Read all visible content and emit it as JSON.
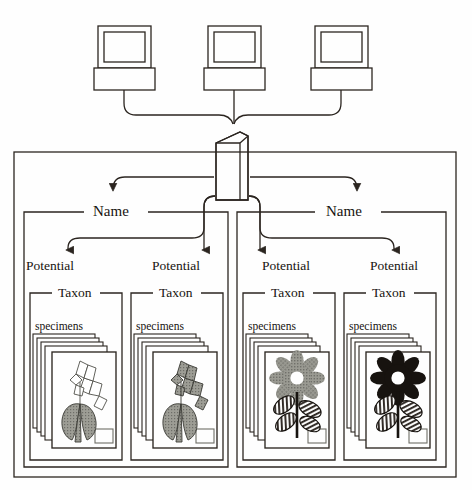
{
  "diagram": {
    "colors": {
      "line": "#2b2520",
      "background": "#fefefe",
      "leaf_gray": "#8d8d85",
      "flower_gray": "#8a8a83",
      "flower_black": "#17130f"
    },
    "clients": [
      {
        "name": "client-workstation-1"
      },
      {
        "name": "client-workstation-2"
      },
      {
        "name": "client-workstation-3"
      }
    ],
    "server": {
      "name": "database-server"
    },
    "name_groups": [
      {
        "label": "Name",
        "potentials": [
          {
            "label": "Potential",
            "taxon": {
              "label": "Taxon",
              "specimens_label": "specimens",
              "card_count": 5,
              "illustration": "grass-outline-head"
            }
          },
          {
            "label": "Potential",
            "taxon": {
              "label": "Taxon",
              "specimens_label": "specimens",
              "card_count": 5,
              "illustration": "grass-gray-head"
            }
          }
        ]
      },
      {
        "label": "Name",
        "potentials": [
          {
            "label": "Potential",
            "taxon": {
              "label": "Taxon",
              "specimens_label": "specimens",
              "card_count": 5,
              "illustration": "daisy-gray"
            }
          },
          {
            "label": "Potential",
            "taxon": {
              "label": "Taxon",
              "specimens_label": "specimens",
              "card_count": 5,
              "illustration": "daisy-black"
            }
          }
        ]
      }
    ]
  }
}
